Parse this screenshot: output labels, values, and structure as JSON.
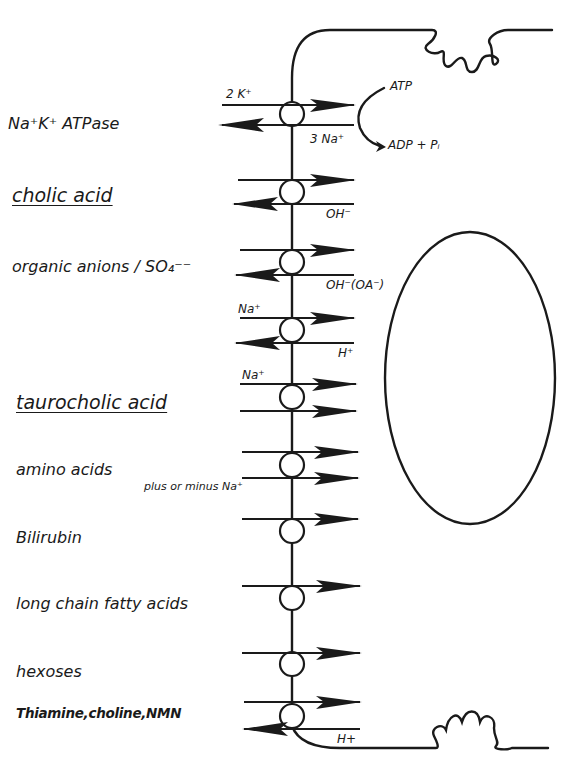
{
  "diagram": {
    "transporters": [
      {
        "id": "na-k-atpase",
        "label": "Na⁺K⁺ ATPase",
        "y": 114,
        "inward_ion": "2 K⁺",
        "outward_ion": "3 Na⁺",
        "energy": {
          "in": "ATP",
          "out": "ADP + Pᵢ"
        }
      },
      {
        "id": "cholic-acid",
        "label": "cholic acid",
        "emphasis": "underlined",
        "y": 192,
        "outward_ion": "OH⁻"
      },
      {
        "id": "organic-anions",
        "label": "organic anions / SO₄⁻⁻",
        "y": 262,
        "outward_ion": "OH⁻ (OA⁻)"
      },
      {
        "id": "na-h-exchange",
        "label": "",
        "y": 330,
        "inward_ion": "Na⁺",
        "outward_ion": "H⁺"
      },
      {
        "id": "taurocholic-acid",
        "label": "taurocholic acid",
        "emphasis": "underlined",
        "y": 397,
        "inward_ion": "Na⁺"
      },
      {
        "id": "amino-acids",
        "label": "amino acids",
        "y": 465,
        "cotransport_note": "plus or minus Na⁺"
      },
      {
        "id": "bilirubin",
        "label": "Bilirubin",
        "y": 531
      },
      {
        "id": "long-chain-fatty-acids",
        "label": "long chain fatty acids",
        "y": 598
      },
      {
        "id": "hexoses",
        "label": "hexoses",
        "y": 664
      },
      {
        "id": "thiamine-choline-nmn",
        "label": "Thiamine,choline,NMN",
        "y": 716,
        "outward_ion": "H+"
      }
    ],
    "ion_labels": {
      "k_in": "2 K⁺",
      "na_out": "3 Na⁺",
      "atp": "ATP",
      "adp_pi": "ADP + Pᵢ",
      "oh_cholic": "OH⁻",
      "oh_oa": "OH⁻(OA⁻)",
      "na_exchanger": "Na⁺",
      "h_exchanger": "H⁺",
      "na_tauro": "Na⁺",
      "plus_minus_na": "plus or minus Na⁺",
      "h_bottom": "H+"
    },
    "labels": {
      "na_k_atpase": "Na⁺K⁺ ATPase",
      "cholic_acid": "cholic acid",
      "organic_anions": "organic anions / SO₄⁻⁻",
      "taurocholic_acid": "taurocholic acid",
      "amino_acids": "amino acids",
      "bilirubin": "Bilirubin",
      "long_chain_fatty_acids": "long chain fatty acids",
      "hexoses": "hexoses",
      "thiamine": "Thiamine,choline,NMN"
    },
    "colors": {
      "ink": "#1a1a1a",
      "background": "#ffffff"
    }
  }
}
